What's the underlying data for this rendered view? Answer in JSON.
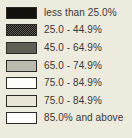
{
  "chart_data": {
    "type": "table",
    "title": "",
    "subtitle": "",
    "xlabel": "",
    "ylabel": "",
    "legend_position": "standalone",
    "grid": false,
    "categories": [
      "less than 25.0%",
      "25.0 - 44.9%",
      "45.0 - 64.9%",
      "65.0 - 74.9%",
      "75.0 - 84.9%",
      "75.0 - 84.9%",
      "85.0% and above"
    ],
    "values": [
      1,
      2,
      3,
      4,
      5,
      6,
      7
    ],
    "series": [
      {
        "name": "legend classes",
        "values": [
          1,
          2,
          3,
          4,
          5,
          6,
          7
        ]
      }
    ]
  },
  "legend": {
    "entries": [
      {
        "label": "less than 25.0%",
        "swatch": "solid-black",
        "color": "#12110e"
      },
      {
        "label": "25.0 - 44.9%",
        "swatch": "dither-dark",
        "color": "#5e5c54"
      },
      {
        "label": "45.0 - 64.9%",
        "swatch": "gray-dark",
        "color": "#625f57"
      },
      {
        "label": "65.0 - 74.9%",
        "swatch": "gray-light",
        "color": "#bdbab0"
      },
      {
        "label": "75.0 - 84.9%",
        "swatch": "white",
        "color": "#fdfdf9"
      },
      {
        "label": "75.0 - 84.9%",
        "swatch": "cream",
        "color": "#e9e6d8"
      },
      {
        "label": "85.0% and above",
        "swatch": "paper",
        "color": "#ffffff"
      }
    ],
    "background_color": "#edeade",
    "text_color": "#3a3832",
    "border_color": "#2b2a26"
  }
}
